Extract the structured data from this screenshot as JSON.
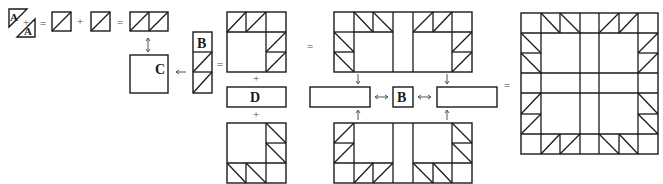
{
  "diagram": {
    "type": "quilt-block-assembly",
    "labels": {
      "a": "A",
      "b": "B",
      "c": "C",
      "d": "D"
    },
    "operators": {
      "equals": "=",
      "plus": "+"
    },
    "colors": {
      "line": "#1a1a1a",
      "arrow": "#555555",
      "background": "#ffffff"
    },
    "steps": [
      {
        "id": "step-1",
        "description": "Two A triangles join to form a half-square triangle unit"
      },
      {
        "id": "step-2",
        "description": "Two half-square triangle units join into a pair"
      },
      {
        "id": "step-3",
        "description": "Pair and B-column units attach around square C"
      },
      {
        "id": "step-4",
        "description": "Corner units join with D strips"
      },
      {
        "id": "step-5",
        "description": "Rows assembled with center B square"
      },
      {
        "id": "step-6",
        "description": "Finished block"
      }
    ]
  }
}
